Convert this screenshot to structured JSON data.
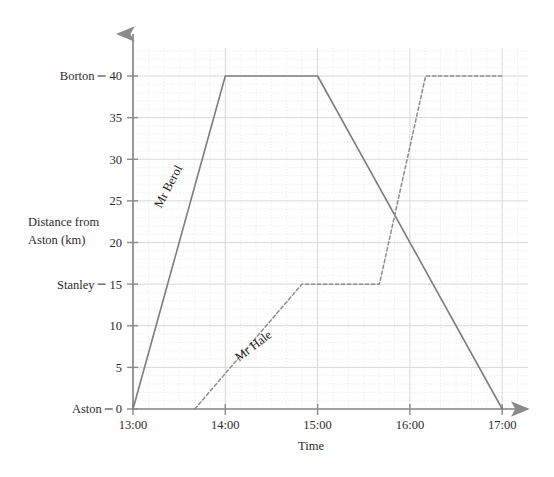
{
  "chart_data": {
    "type": "line",
    "title": "",
    "xlabel": "Time",
    "ylabel_line1": "Distance from",
    "ylabel_line2": "Aston (km)",
    "xlim": [
      13.0,
      17.5
    ],
    "ylim": [
      0,
      43
    ],
    "grid": true,
    "grid_major_x_hours": 1,
    "grid_minor_x_minutes": 10,
    "grid_major_y_km": 5,
    "grid_minor_y_km": 1,
    "legend_position": "inline-along-lines",
    "x_ticks": [
      {
        "value": 13.0,
        "label": "13:00"
      },
      {
        "value": 14.0,
        "label": "14:00"
      },
      {
        "value": 15.0,
        "label": "15:00"
      },
      {
        "value": 16.0,
        "label": "16:00"
      },
      {
        "value": 17.0,
        "label": "17:00"
      }
    ],
    "y_ticks": [
      {
        "value": 0,
        "label": "0",
        "place": "Aston"
      },
      {
        "value": 5,
        "label": "5",
        "place": ""
      },
      {
        "value": 10,
        "label": "10",
        "place": ""
      },
      {
        "value": 15,
        "label": "15",
        "place": "Stanley"
      },
      {
        "value": 20,
        "label": "20",
        "place": ""
      },
      {
        "value": 25,
        "label": "25",
        "place": ""
      },
      {
        "value": 30,
        "label": "30",
        "place": ""
      },
      {
        "value": 35,
        "label": "35",
        "place": ""
      },
      {
        "value": 40,
        "label": "40",
        "place": "Borton"
      }
    ],
    "series": [
      {
        "name": "Mr Berol",
        "style": "solid",
        "color": "#7d7d7d",
        "points": [
          {
            "t": 13.0,
            "km": 0
          },
          {
            "t": 14.0,
            "km": 40
          },
          {
            "t": 15.0,
            "km": 40
          },
          {
            "t": 17.0,
            "km": 0
          }
        ],
        "label_anchor": {
          "t": 13.42,
          "km": 26.5
        },
        "label_rotation_deg": -62
      },
      {
        "name": "Mr Hale",
        "style": "dashed",
        "color": "#8d8d8d",
        "points": [
          {
            "t": 13.67,
            "km": 0
          },
          {
            "t": 14.83,
            "km": 15
          },
          {
            "t": 15.67,
            "km": 15
          },
          {
            "t": 16.17,
            "km": 40
          },
          {
            "t": 17.0,
            "km": 40
          }
        ],
        "label_anchor": {
          "t": 14.33,
          "km": 7.2
        },
        "label_rotation_deg": -37
      }
    ],
    "annotations": [
      {
        "name": "crossing",
        "t": 15.83,
        "km": 25
      }
    ]
  },
  "axes": {
    "y_arrow": true,
    "x_arrow": true,
    "axis_color": "#8a8a8a",
    "grid_major_color": "#d8d8d8",
    "grid_minor_color": "#e2e2e2"
  }
}
